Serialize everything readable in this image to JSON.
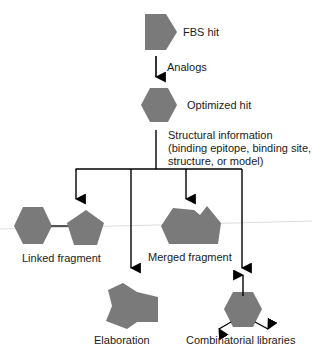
{
  "colors": {
    "shape_fill": "#7a7a7a",
    "line": "#000000",
    "background": "#ffffff",
    "faint_rule": "#d8d8d8"
  },
  "nodes": {
    "fbs_hit": {
      "label": "FBS hit",
      "shape": "pentagon-arrow"
    },
    "analogs": {
      "label": "Analogs",
      "shape": "down-arrow"
    },
    "optimized_hit": {
      "label": "Optimized hit",
      "shape": "hexagon"
    },
    "structural_info": {
      "line1": "Structural information",
      "line2": "(binding epitope, binding site,",
      "line3": "structure, or model)"
    },
    "linked_fragment": {
      "label": "Linked fragment",
      "shape": "hexagon-linked-pentagon"
    },
    "merged_fragment": {
      "label": "Merged fragment",
      "shape": "merged-polygon"
    },
    "elaboration": {
      "label": "Elaboration",
      "shape": "elaborated-polygon"
    },
    "combinatorial_libraries": {
      "label": "Combinatorial libraries",
      "shape": "hexagon-with-outward-arrows"
    }
  }
}
